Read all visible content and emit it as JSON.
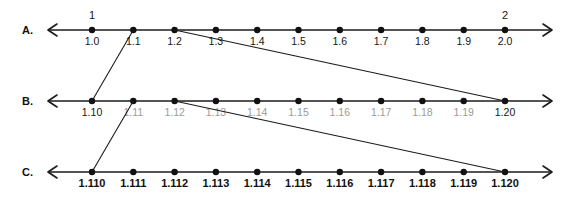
{
  "figure": {
    "title": "",
    "width": 576,
    "height": 212,
    "background": "#ffffff",
    "line_color": "#1b1b1b",
    "dot_color": "#111111",
    "grey_label_color": "#9a9a9a",
    "black_label_color": "#161616"
  },
  "chart_data": {
    "type": "line",
    "title": "",
    "xlabel": "",
    "ylabel": "",
    "rows": [
      {
        "letter": "A.",
        "row_id": "row-a",
        "start": "1.0",
        "end": "2.0",
        "step": "0.1",
        "whole_labels": [
          {
            "text": "1",
            "at": "1.0"
          },
          {
            "text": "2",
            "at": "2.0"
          }
        ],
        "ticks": [
          {
            "label": "1.0",
            "value": 1.0,
            "color": "black"
          },
          {
            "label": "1.1",
            "value": 1.1,
            "color": "black"
          },
          {
            "label": "1.2",
            "value": 1.2,
            "color": "black"
          },
          {
            "label": "1.3",
            "value": 1.3,
            "color": "black"
          },
          {
            "label": "1.4",
            "value": 1.4,
            "color": "black"
          },
          {
            "label": "1.5",
            "value": 1.5,
            "color": "black"
          },
          {
            "label": "1.6",
            "value": 1.6,
            "color": "black"
          },
          {
            "label": "1.7",
            "value": 1.7,
            "color": "black"
          },
          {
            "label": "1.8",
            "value": 1.8,
            "color": "black"
          },
          {
            "label": "1.9",
            "value": 1.9,
            "color": "black"
          },
          {
            "label": "2.0",
            "value": 2.0,
            "color": "black"
          }
        ]
      },
      {
        "letter": "B.",
        "row_id": "row-b",
        "start": "1.10",
        "end": "1.20",
        "step": "0.01",
        "whole_labels": [],
        "ticks": [
          {
            "label": "1.10",
            "value": 1.1,
            "color": "black"
          },
          {
            "label": "1.11",
            "value": 1.11,
            "color": "grey"
          },
          {
            "label": "1.12",
            "value": 1.12,
            "color": "grey"
          },
          {
            "label": "1.13",
            "value": 1.13,
            "color": "grey"
          },
          {
            "label": "1.14",
            "value": 1.14,
            "color": "grey"
          },
          {
            "label": "1.15",
            "value": 1.15,
            "color": "grey"
          },
          {
            "label": "1.16",
            "value": 1.16,
            "color": "grey"
          },
          {
            "label": "1.17",
            "value": 1.17,
            "color": "grey"
          },
          {
            "label": "1.18",
            "value": 1.18,
            "color": "grey"
          },
          {
            "label": "1.19",
            "value": 1.19,
            "color": "grey"
          },
          {
            "label": "1.20",
            "value": 1.2,
            "color": "black"
          }
        ]
      },
      {
        "letter": "C.",
        "row_id": "row-c",
        "start": "1.110",
        "end": "1.120",
        "step": "0.001",
        "whole_labels": [],
        "ticks": [
          {
            "label": "1.110",
            "value": 1.11,
            "color": "boldc"
          },
          {
            "label": "1.111",
            "value": 1.111,
            "color": "boldc"
          },
          {
            "label": "1.112",
            "value": 1.112,
            "color": "boldc"
          },
          {
            "label": "1.113",
            "value": 1.113,
            "color": "boldc"
          },
          {
            "label": "1.114",
            "value": 1.114,
            "color": "boldc"
          },
          {
            "label": "1.115",
            "value": 1.115,
            "color": "boldc"
          },
          {
            "label": "1.116",
            "value": 1.116,
            "color": "boldc"
          },
          {
            "label": "1.117",
            "value": 1.117,
            "color": "boldc"
          },
          {
            "label": "1.118",
            "value": 1.118,
            "color": "boldc"
          },
          {
            "label": "1.119",
            "value": 1.119,
            "color": "boldc"
          },
          {
            "label": "1.120",
            "value": 1.12,
            "color": "boldc"
          }
        ]
      }
    ],
    "connectors": [
      {
        "id": "a-to-b-left",
        "from_row": "A",
        "from_tick": "1.1",
        "to_row": "B",
        "to_tick": "1.10"
      },
      {
        "id": "a-to-b-right",
        "from_row": "A",
        "from_tick": "1.2",
        "to_row": "B",
        "to_tick": "1.20"
      },
      {
        "id": "b-to-c-left",
        "from_row": "B",
        "from_tick": "1.11",
        "to_row": "C",
        "to_tick": "1.110"
      },
      {
        "id": "b-to-c-right",
        "from_row": "B",
        "from_tick": "1.12",
        "to_row": "C",
        "to_tick": "1.120"
      }
    ]
  }
}
